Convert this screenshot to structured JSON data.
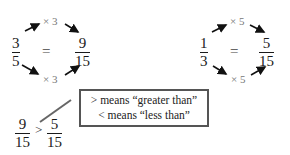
{
  "example_left": {
    "fraction_a": {
      "numerator": "3",
      "denominator": "5"
    },
    "equals": "=",
    "fraction_b": {
      "numerator": "9",
      "denominator": "15"
    },
    "top_multiplier": "× 3",
    "bottom_multiplier": "× 3"
  },
  "example_right": {
    "fraction_a": {
      "numerator": "1",
      "denominator": "3"
    },
    "equals": "=",
    "fraction_b": {
      "numerator": "5",
      "denominator": "15"
    },
    "top_multiplier": "× 5",
    "bottom_multiplier": "× 5"
  },
  "comparison": {
    "left": {
      "numerator": "9",
      "denominator": "15"
    },
    "operator": ">",
    "right": {
      "numerator": "5",
      "denominator": "15"
    }
  },
  "legend_box": {
    "line1": "> means “greater than”",
    "line2": "<  means “less than”"
  }
}
